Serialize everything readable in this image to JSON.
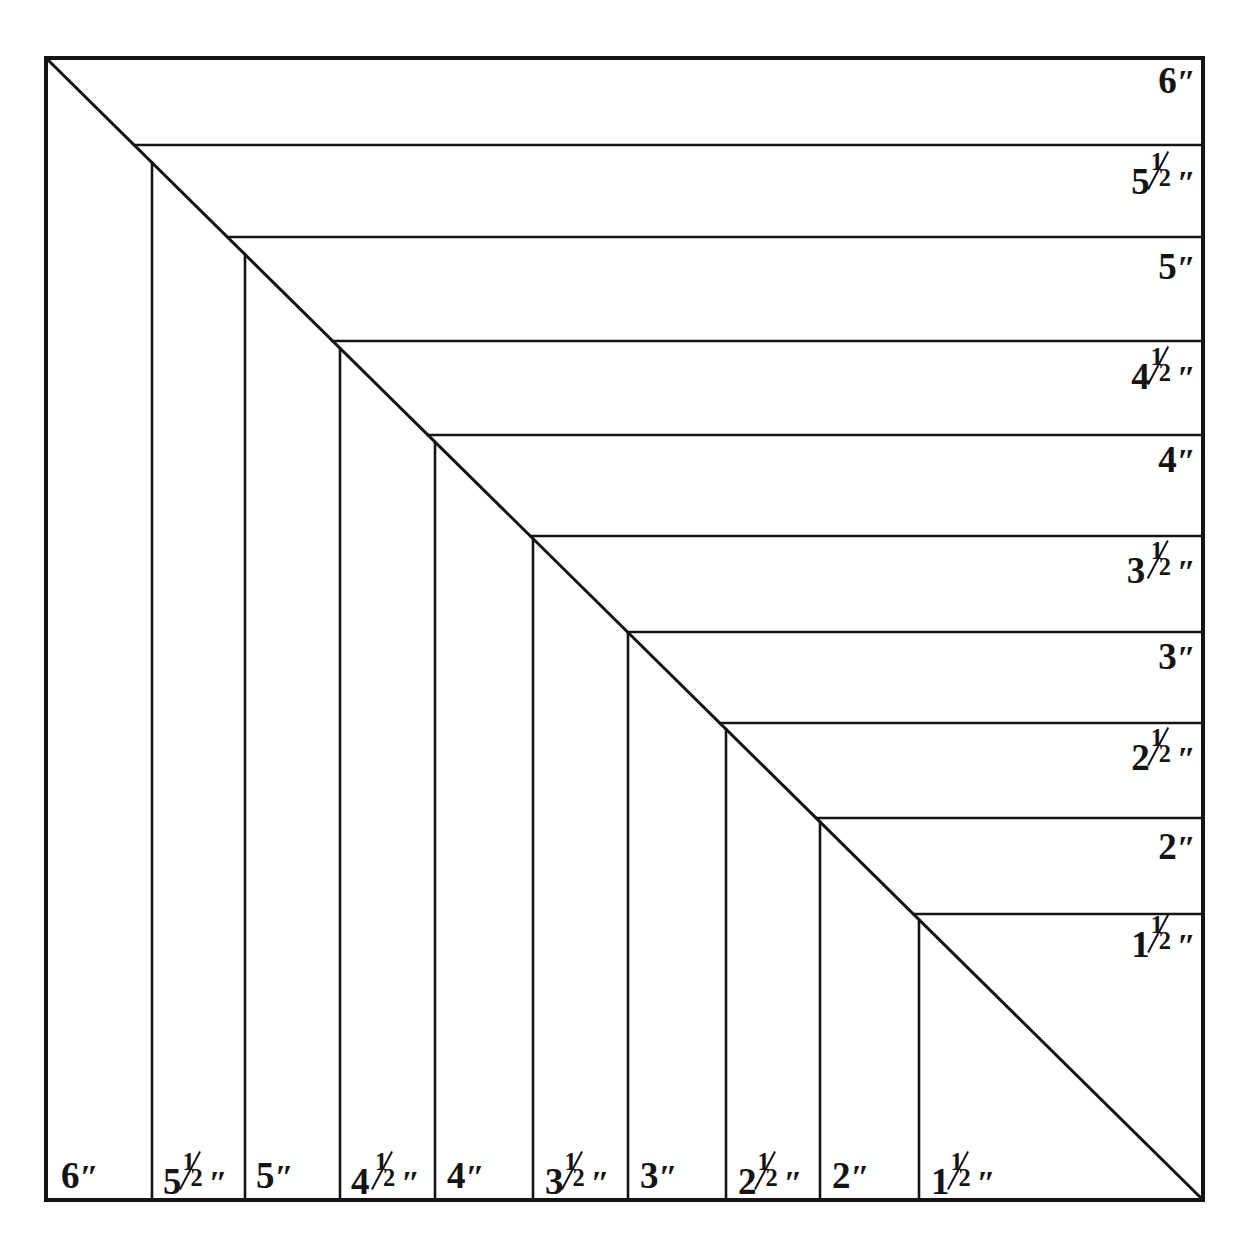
{
  "figure": {
    "kind": "nested-square-size-chart",
    "background_color": "#ffffff",
    "line_color": "#141414",
    "text_color": "#141414",
    "frame": {
      "left": 46,
      "top": 58,
      "right": 1203,
      "bottom": 1200,
      "border_width": 4
    },
    "diagonal": {
      "from": [
        46,
        58
      ],
      "to": [
        1203,
        1200
      ],
      "width": 3
    },
    "inner_line_width": 2.6
  },
  "chart_data": {
    "type": "diagram",
    "title": "",
    "subtitle": "",
    "xlabel": "",
    "ylabel": "",
    "unit": "inch",
    "unit_symbol": "″",
    "sizes_inches": [
      6,
      5.5,
      5,
      4.5,
      4,
      3.5,
      3,
      2.5,
      2,
      1.5
    ],
    "band_count": 10,
    "right_column_labels": [
      "6″",
      "5½″",
      "5″",
      "4½″",
      "4″",
      "3½″",
      "3″",
      "2½″",
      "2″",
      "1½″"
    ],
    "bottom_row_labels": [
      "6″",
      "5½″",
      "5″",
      "4½″",
      "4″",
      "3½″",
      "3″",
      "2½″",
      "2″",
      "1½″"
    ],
    "horizontal_line_y": [
      58,
      145,
      237,
      341,
      435,
      536,
      632,
      723,
      818,
      914,
      1200
    ],
    "vertical_line_x": [
      46,
      152,
      245,
      340,
      435,
      533,
      628,
      726,
      820,
      919,
      1203
    ]
  },
  "right_labels": [
    {
      "whole": "6",
      "num": "",
      "den": "",
      "prime": "″",
      "space": false,
      "y": 62,
      "fs": 37
    },
    {
      "whole": "5",
      "num": "1",
      "den": "2",
      "prime": "″",
      "space": false,
      "y": 157,
      "fs": 37
    },
    {
      "whole": "5",
      "num": "",
      "den": "",
      "prime": "″",
      "space": false,
      "y": 248,
      "fs": 37
    },
    {
      "whole": "4",
      "num": "1",
      "den": "2",
      "prime": "″",
      "space": false,
      "y": 352,
      "fs": 37
    },
    {
      "whole": "4",
      "num": "",
      "den": "",
      "prime": "″",
      "space": false,
      "y": 441,
      "fs": 37
    },
    {
      "whole": "3",
      "num": "1",
      "den": "2",
      "prime": "″",
      "space": true,
      "y": 546,
      "fs": 37
    },
    {
      "whole": "3",
      "num": "",
      "den": "",
      "prime": "″",
      "space": false,
      "y": 638,
      "fs": 37
    },
    {
      "whole": "2",
      "num": "1",
      "den": "2",
      "prime": "″",
      "space": false,
      "y": 733,
      "fs": 37
    },
    {
      "whole": "2",
      "num": "",
      "den": "",
      "prime": "″",
      "space": false,
      "y": 828,
      "fs": 37
    },
    {
      "whole": "1",
      "num": "1",
      "den": "2",
      "prime": "″",
      "space": false,
      "y": 920,
      "fs": 37
    }
  ],
  "bottom_labels": [
    {
      "whole": "6",
      "num": "",
      "den": "",
      "prime": "″",
      "space": false,
      "x": 61,
      "fs": 37
    },
    {
      "whole": "5",
      "num": "1",
      "den": "2",
      "prime": "″",
      "space": false,
      "x": 163,
      "fs": 37
    },
    {
      "whole": "5",
      "num": "",
      "den": "",
      "prime": "″",
      "space": false,
      "x": 256,
      "fs": 37
    },
    {
      "whole": "4",
      "num": "1",
      "den": "2",
      "prime": "″",
      "space": true,
      "x": 351,
      "fs": 37
    },
    {
      "whole": "4",
      "num": "",
      "den": "",
      "prime": "″",
      "space": false,
      "x": 447,
      "fs": 37
    },
    {
      "whole": "3",
      "num": "1",
      "den": "2",
      "prime": "″",
      "space": false,
      "x": 545,
      "fs": 37
    },
    {
      "whole": "3",
      "num": "",
      "den": "",
      "prime": "″",
      "space": false,
      "x": 640,
      "fs": 37
    },
    {
      "whole": "2",
      "num": "1",
      "den": "2",
      "prime": "″",
      "space": false,
      "x": 738,
      "fs": 37
    },
    {
      "whole": "2",
      "num": "",
      "den": "",
      "prime": "″",
      "space": false,
      "x": 832,
      "fs": 37
    },
    {
      "whole": "1",
      "num": "1",
      "den": "2",
      "prime": "″",
      "space": false,
      "x": 931,
      "fs": 37
    }
  ],
  "bottom_label_baseline_y": 1157
}
